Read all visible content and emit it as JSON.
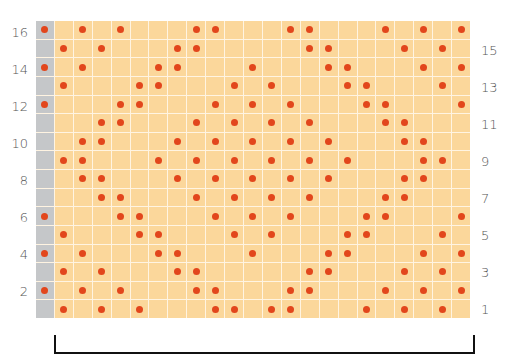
{
  "chart_data": {
    "type": "table",
    "title": "",
    "grid": {
      "columns": 23,
      "rows": 16
    },
    "colors": {
      "background_cell": "#fbd79b",
      "edge_stitch": "#c5c7c9",
      "dot": "#e2461c",
      "grid_line": "#fff4e2"
    },
    "legend": [],
    "row_labels_left": [
      "2",
      "4",
      "6",
      "8",
      "10",
      "12",
      "14",
      "16"
    ],
    "row_labels_right": [
      "1",
      "3",
      "5",
      "7",
      "9",
      "11",
      "13",
      "15"
    ],
    "edge_column": 0,
    "rows": [
      {
        "row": 16,
        "dots": [
          0,
          2,
          4,
          8,
          9,
          13,
          14,
          18,
          20,
          22
        ]
      },
      {
        "row": 15,
        "dots": [
          1,
          3,
          7,
          8,
          14,
          15,
          19,
          21
        ]
      },
      {
        "row": 14,
        "dots": [
          0,
          2,
          6,
          7,
          11,
          15,
          16,
          20,
          22
        ]
      },
      {
        "row": 13,
        "dots": [
          1,
          5,
          6,
          10,
          12,
          16,
          17,
          21
        ]
      },
      {
        "row": 12,
        "dots": [
          0,
          4,
          5,
          9,
          11,
          13,
          17,
          18,
          22
        ]
      },
      {
        "row": 11,
        "dots": [
          3,
          4,
          8,
          10,
          12,
          14,
          18,
          19
        ]
      },
      {
        "row": 10,
        "dots": [
          2,
          3,
          7,
          9,
          11,
          13,
          15,
          19,
          20
        ]
      },
      {
        "row": 9,
        "dots": [
          1,
          2,
          6,
          8,
          10,
          12,
          14,
          16,
          20,
          21
        ]
      },
      {
        "row": 8,
        "dots": [
          2,
          3,
          7,
          9,
          11,
          13,
          15,
          19,
          20
        ]
      },
      {
        "row": 7,
        "dots": [
          3,
          4,
          8,
          10,
          12,
          14,
          18,
          19
        ]
      },
      {
        "row": 6,
        "dots": [
          0,
          4,
          5,
          9,
          11,
          13,
          17,
          18,
          22
        ]
      },
      {
        "row": 5,
        "dots": [
          1,
          5,
          6,
          10,
          12,
          16,
          17,
          21
        ]
      },
      {
        "row": 4,
        "dots": [
          0,
          2,
          6,
          7,
          11,
          15,
          16,
          20,
          22
        ]
      },
      {
        "row": 3,
        "dots": [
          1,
          3,
          7,
          8,
          14,
          15,
          19,
          21
        ]
      },
      {
        "row": 2,
        "dots": [
          0,
          2,
          4,
          8,
          9,
          13,
          14,
          18,
          20,
          22
        ]
      },
      {
        "row": 1,
        "dots": [
          1,
          3,
          5,
          9,
          10,
          12,
          13,
          17,
          19,
          21
        ]
      }
    ],
    "bracket": {
      "span_columns": [
        1,
        22
      ],
      "label": ""
    }
  },
  "labels": {
    "left": {
      "r16": "16",
      "r14": "14",
      "r12": "12",
      "r10": "10",
      "r8": "8",
      "r6": "6",
      "r4": "4",
      "r2": "2"
    },
    "right": {
      "r15": "15",
      "r13": "13",
      "r11": "11",
      "r9": "9",
      "r7": "7",
      "r5": "5",
      "r3": "3",
      "r1": "1"
    }
  }
}
